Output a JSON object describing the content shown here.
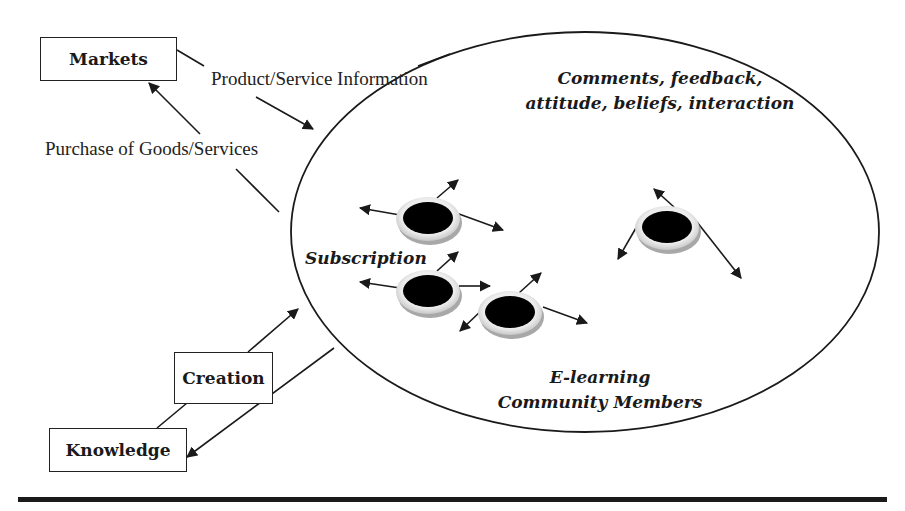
{
  "diagram": {
    "boxes": {
      "markets": "Markets",
      "creation": "Creation",
      "knowledge": "Knowledge"
    },
    "flow_labels": {
      "product_service_information": "Product/Service Information",
      "purchase_of_goods_services": "Purchase of Goods/Services"
    },
    "ellipse_labels": {
      "comments_line1": "Comments, feedback,",
      "comments_line2": "attitude, beliefs, interaction",
      "subscription": "Subscription",
      "community_line1": "E-learning",
      "community_line2": "Community Members"
    },
    "member_nodes": [
      {
        "id": "member-1",
        "cx": 428,
        "cy": 219
      },
      {
        "id": "member-2",
        "cx": 428,
        "cy": 292
      },
      {
        "id": "member-3",
        "cx": 510,
        "cy": 313
      },
      {
        "id": "member-4",
        "cx": 667,
        "cy": 228
      }
    ],
    "colors": {
      "ink": "#1a1a1a",
      "node_fill": "#000000",
      "node_ring": "#e6e6e6",
      "node_shadow": "#a8a8a8"
    }
  }
}
